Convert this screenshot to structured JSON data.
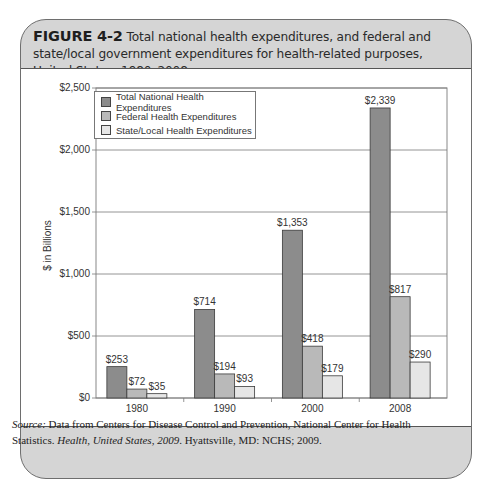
{
  "figure": {
    "number": "FIGURE 4-2",
    "caption": "Total national health expenditures, and federal and state/local government expenditures for health-related purposes, United States, 1980–2008."
  },
  "source": {
    "label": "Source:",
    "text": " Data from Centers for Disease Control and Prevention, National Center for Health Statistics. ",
    "title": "Health, United States, 2009",
    "rest": ". Hyattsville, MD: NCHS; 2009."
  },
  "colors": {
    "total": "#8c8c8c",
    "federal": "#b9b9b9",
    "state_local": "#e6e6e6",
    "frame": "#d5d5d5"
  },
  "chart_data": {
    "type": "bar",
    "title": "Total national health expenditures, and federal and state/local government expenditures for health-related purposes, United States, 1980–2008.",
    "xlabel": "",
    "ylabel": "$ in Billions",
    "categories": [
      "1980",
      "1990",
      "2000",
      "2008"
    ],
    "series": [
      {
        "name": "Total National Health Expenditures",
        "values": [
          253,
          714,
          1353,
          2339
        ],
        "labels": [
          "$253",
          "$714",
          "$1,353",
          "$2,339"
        ]
      },
      {
        "name": "Federal Health Expenditures",
        "values": [
          72,
          194,
          418,
          817
        ],
        "labels": [
          "$72",
          "$194",
          "$418",
          "$817"
        ]
      },
      {
        "name": "State/Local Health Expenditures",
        "values": [
          35,
          93,
          179,
          290
        ],
        "labels": [
          "$35",
          "$93",
          "$179",
          "$290"
        ]
      }
    ],
    "ylim": [
      0,
      2500
    ],
    "yticks": [
      0,
      500,
      1000,
      1500,
      2000,
      2500
    ],
    "ytick_labels": [
      "$0",
      "$500",
      "$1,000",
      "$1,500",
      "$2,000",
      "$2,500"
    ],
    "grid": true,
    "legend_position": "upper left"
  }
}
